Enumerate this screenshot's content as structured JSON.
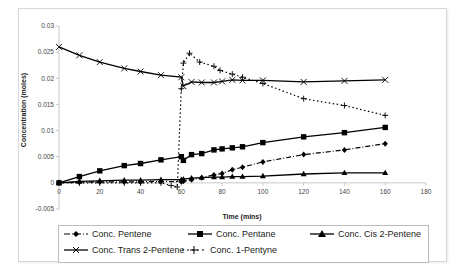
{
  "chart_data": {
    "type": "line",
    "title": "",
    "xlabel": "Time (mins)",
    "ylabel": "Concentration (moles)",
    "xlim": [
      0,
      180
    ],
    "ylim": [
      -0.005,
      0.03
    ],
    "xticks": [
      "0",
      "20",
      "40",
      "60",
      "80",
      "100",
      "120",
      "140",
      "160",
      "180"
    ],
    "xtick_values": [
      0,
      20,
      40,
      60,
      80,
      100,
      120,
      140,
      160,
      180
    ],
    "yticks": [
      "-0.005",
      "0",
      "0.005",
      "0.01",
      "0.015",
      "0.02",
      "0.025",
      "0.03"
    ],
    "ytick_values": [
      -0.005,
      0,
      0.005,
      0.01,
      0.015,
      0.02,
      0.025,
      0.03
    ],
    "grid": false,
    "legend_position": "bottom",
    "series": [
      {
        "name": "Conc. Pentene",
        "marker": "diamond",
        "line": "dash-dot",
        "x": [
          0,
          10,
          20,
          32,
          40,
          50,
          60,
          61,
          65,
          70,
          76,
          80,
          85,
          90,
          100,
          120,
          140,
          160
        ],
        "values": [
          0,
          0.0001,
          0.0002,
          0.0002,
          0.0002,
          0.0003,
          0.0002,
          0.0003,
          0.0006,
          0.001,
          0.0015,
          0.0018,
          0.0025,
          0.003,
          0.004,
          0.0054,
          0.0063,
          0.0075
        ]
      },
      {
        "name": "Conc. Pentane",
        "marker": "square",
        "line": "solid",
        "x": [
          0,
          10,
          20,
          32,
          40,
          50,
          60,
          61,
          65,
          70,
          76,
          80,
          85,
          90,
          100,
          120,
          140,
          160
        ],
        "values": [
          0,
          0.0012,
          0.0023,
          0.0033,
          0.0037,
          0.0044,
          0.005,
          0.0043,
          0.0054,
          0.0056,
          0.0063,
          0.0065,
          0.0067,
          0.0069,
          0.0077,
          0.0088,
          0.0096,
          0.0106
        ]
      },
      {
        "name": "Conc. Cis 2-Pentene",
        "marker": "triangle",
        "line": "solid",
        "x": [
          0,
          10,
          20,
          32,
          40,
          50,
          60,
          61,
          65,
          70,
          76,
          80,
          85,
          90,
          100,
          120,
          140,
          160
        ],
        "values": [
          0,
          0.0003,
          0.0004,
          0.0005,
          0.0005,
          0.0006,
          0.0006,
          0.0007,
          0.0009,
          0.001,
          0.0011,
          0.0011,
          0.0012,
          0.0012,
          0.0013,
          0.0017,
          0.0019,
          0.0019
        ]
      },
      {
        "name": "Conc. Trans 2-Pentene",
        "marker": "x",
        "line": "solid",
        "x": [
          0,
          10,
          20,
          32,
          40,
          50,
          60,
          61,
          65,
          70,
          76,
          80,
          85,
          90,
          100,
          120,
          140,
          160
        ],
        "values": [
          0.026,
          0.0244,
          0.0231,
          0.0219,
          0.0213,
          0.0206,
          0.0202,
          0.0185,
          0.0193,
          0.0192,
          0.0192,
          0.0194,
          0.0197,
          0.0196,
          0.0196,
          0.0193,
          0.0195,
          0.0197
        ]
      },
      {
        "name": "Conc. 1-Pentyne",
        "marker": "plus",
        "line": "dotted",
        "x": [
          0,
          10,
          20,
          32,
          40,
          50,
          55,
          58,
          60,
          61,
          64,
          69,
          76,
          79,
          85,
          90,
          100,
          120,
          140,
          160
        ],
        "values": [
          0,
          0,
          0,
          0,
          0,
          0,
          -0.0005,
          -0.0008,
          0.018,
          0.0229,
          0.0248,
          0.0231,
          0.0223,
          0.0215,
          0.0208,
          0.0202,
          0.019,
          0.0161,
          0.0148,
          0.0129
        ]
      }
    ]
  },
  "legend": {
    "items": [
      {
        "label": "Conc. Pentene"
      },
      {
        "label": "Conc. Pentane"
      },
      {
        "label": "Conc. Cis 2-Pentene"
      },
      {
        "label": "Conc. Trans 2-Pentene"
      },
      {
        "label": "Conc. 1-Pentyne"
      }
    ]
  }
}
